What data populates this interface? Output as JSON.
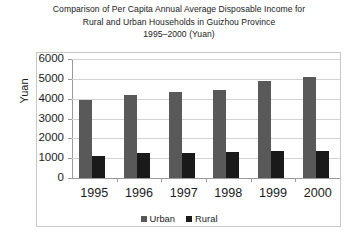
{
  "figure": {
    "title_lines": "Comparison of Per Capita Annual Average Disposable Income for\nRural and Urban Households in Guizhou Province\n1995–2000 (Yuan)",
    "background_color": "#ffffff",
    "border_color": "#c8c8c8"
  },
  "chart_data": {
    "type": "bar",
    "title": "Comparison of Per Capita Annual Average Disposable Income for Rural and Urban Households in Guizhou Province 1995–2000 (Yuan)",
    "xlabel": "",
    "ylabel": "Yuan",
    "categories": [
      "1995",
      "1996",
      "1997",
      "1998",
      "1999",
      "2000"
    ],
    "series": [
      {
        "name": "Urban",
        "color": "#595959",
        "values": [
          3950,
          4200,
          4350,
          4450,
          4900,
          5100
        ]
      },
      {
        "name": "Rural",
        "color": "#1a1a1a",
        "values": [
          1100,
          1250,
          1270,
          1320,
          1350,
          1370
        ]
      }
    ],
    "ylim": [
      0,
      6000
    ],
    "yticks": [
      0,
      1000,
      2000,
      3000,
      4000,
      5000,
      6000
    ],
    "ytick_labels": [
      "0",
      "1000",
      "2000",
      "3000",
      "4000",
      "5000",
      "6000"
    ],
    "grid": true,
    "grid_axis": "y",
    "legend_position": "bottom-center",
    "legend_entries": [
      "Urban",
      "Rural"
    ]
  }
}
